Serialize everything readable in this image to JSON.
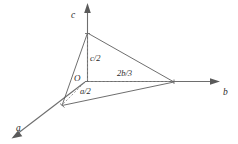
{
  "figure": {
    "type": "crystallographic-axes-plane-diagram",
    "background_color": "#ffffff",
    "line_color": "#6e6e6e",
    "plane_edge_color": "#5e5e5e",
    "dashed_color": "#8a8a8a",
    "text_color": "#2b2b2b"
  },
  "axes": [
    {
      "id": "a",
      "label": "a",
      "direction": "down-left",
      "arrow": true
    },
    {
      "id": "b",
      "label": "b",
      "direction": "right",
      "arrow": true
    },
    {
      "id": "c",
      "label": "c",
      "direction": "up",
      "arrow": true
    }
  ],
  "origin": {
    "label": "O"
  },
  "intercepts": [
    {
      "axis": "a",
      "label": "a/2",
      "value": "a/2"
    },
    {
      "axis": "b",
      "label": "2b/3",
      "value": "2b/3"
    },
    {
      "axis": "c",
      "label": "c/2",
      "value": "c/2"
    }
  ],
  "plane": {
    "name": "intercept-triangle",
    "vertices": [
      "a/2",
      "2b/3",
      "c/2"
    ]
  }
}
